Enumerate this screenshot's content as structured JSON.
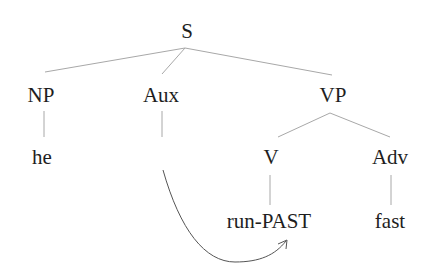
{
  "diagram": {
    "type": "syntax-tree",
    "nodes": {
      "S": "S",
      "NP": "NP",
      "Aux": "Aux",
      "VP": "VP",
      "he": "he",
      "V": "V",
      "Adv": "Adv",
      "run_past": "run-PAST",
      "fast": "fast"
    },
    "edges": [
      [
        "S",
        "NP"
      ],
      [
        "S",
        "Aux"
      ],
      [
        "S",
        "VP"
      ],
      [
        "NP",
        "he"
      ],
      [
        "VP",
        "V"
      ],
      [
        "VP",
        "Adv"
      ],
      [
        "V",
        "run-PAST"
      ],
      [
        "Adv",
        "fast"
      ]
    ],
    "movement_arrow": {
      "from": "Aux",
      "to": "run-PAST"
    },
    "colors": {
      "text": "#1e1e1e",
      "line": "#a8a8a8",
      "arrow": "#555555"
    }
  }
}
